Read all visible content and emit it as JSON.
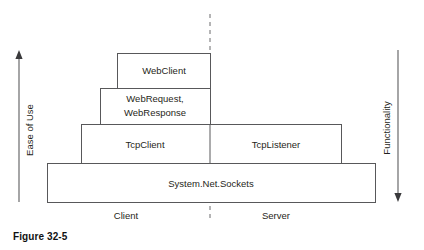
{
  "figure": {
    "caption": "Figure 32-5"
  },
  "axes": {
    "left": {
      "label": "Ease of Use",
      "direction": "up",
      "arrow_icon": "arrow-up-icon"
    },
    "right": {
      "label": "Functionality",
      "direction": "down",
      "arrow_icon": "arrow-down-icon"
    }
  },
  "divider": {
    "style": "dashed",
    "orientation": "vertical"
  },
  "zones": [
    {
      "id": "client",
      "label": "Client"
    },
    {
      "id": "server",
      "label": "Server"
    }
  ],
  "layers": [
    {
      "id": "webclient",
      "label": "WebClient",
      "lines": [
        "WebClient"
      ],
      "level": 1,
      "side": "client"
    },
    {
      "id": "webrequest-webresponse",
      "label": "WebRequest, WebResponse",
      "lines": [
        "WebRequest,",
        "WebResponse"
      ],
      "level": 2,
      "side": "client"
    },
    {
      "id": "tcpclient",
      "label": "TcpClient",
      "lines": [
        "TcpClient"
      ],
      "level": 3,
      "side": "client"
    },
    {
      "id": "tcplistener",
      "label": "TcpListener",
      "lines": [
        "TcpListener"
      ],
      "level": 3,
      "side": "server"
    },
    {
      "id": "system-net-sockets",
      "label": "System.Net.Sockets",
      "lines": [
        "System.Net.Sockets"
      ],
      "level": 4,
      "side": "both"
    }
  ],
  "colors": {
    "stroke": "#58585a",
    "dashed": "#6a6a6c",
    "text": "#1f1f20",
    "background": "#ffffff"
  }
}
